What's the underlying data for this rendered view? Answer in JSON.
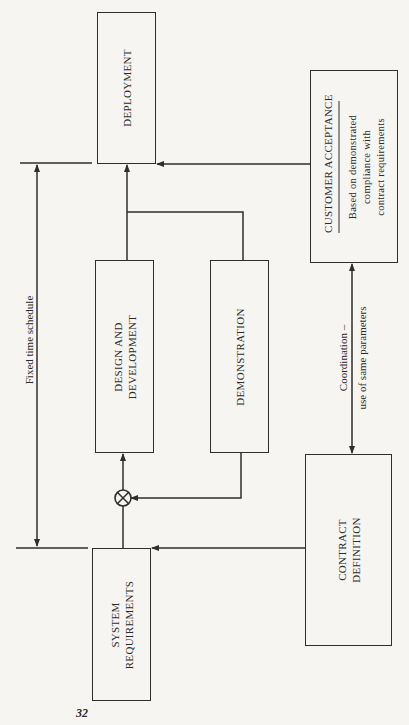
{
  "diagram": {
    "boxes": {
      "deployment": {
        "label": "DEPLOYMENT"
      },
      "customer_acceptance": {
        "title": "CUSTOMER ACCEPTANCE",
        "subtitle_lines": [
          "Based on demonstrated",
          "compliance with",
          "contract requirements"
        ]
      },
      "design_development": {
        "label_lines": [
          "DESIGN AND",
          "DEVELOPMENT"
        ]
      },
      "demonstration": {
        "label": "DEMONSTRATION"
      },
      "system_requirements": {
        "label_lines": [
          "SYSTEM",
          "REQUIREMENTS"
        ]
      },
      "contract_definition": {
        "label_lines": [
          "CONTRACT",
          "DEFINITION"
        ]
      }
    },
    "annotations": {
      "fixed_time_schedule": "Fixed time schedule",
      "coordination_lines": [
        "Coordination –",
        "use of same parameters"
      ]
    },
    "summing_junction": {
      "symbol": "⊗",
      "icon": "summing-junction-icon"
    },
    "connections": [
      {
        "from": "system_requirements",
        "to": "summing_junction"
      },
      {
        "from": "demonstration",
        "to": "summing_junction"
      },
      {
        "from": "summing_junction",
        "to": "design_development"
      },
      {
        "from": "design_development",
        "to": "deployment"
      },
      {
        "from": "demonstration",
        "to": "deployment"
      },
      {
        "from": "customer_acceptance",
        "to": "deployment"
      },
      {
        "from": "contract_definition",
        "to": "system_requirements"
      },
      {
        "between": [
          "customer_acceptance",
          "contract_definition"
        ],
        "type": "bidirectional",
        "label": "coordination"
      },
      {
        "between": [
          "deployment_milestone",
          "system_requirements_milestone"
        ],
        "type": "bidirectional",
        "label": "fixed_time_schedule"
      }
    ],
    "colors": {
      "line": "#2e2e2e",
      "background": "#f6f5f2"
    }
  },
  "page": {
    "number": "32"
  }
}
